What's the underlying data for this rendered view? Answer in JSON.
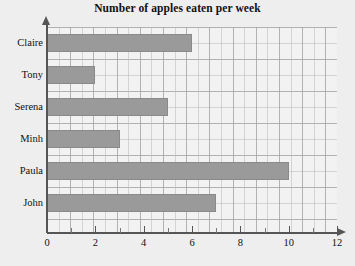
{
  "chart_data": {
    "type": "bar",
    "orientation": "horizontal",
    "title": "Number of apples eaten per week",
    "xlabel": "",
    "ylabel": "",
    "categories": [
      "Claire",
      "Tony",
      "Serena",
      "Minh",
      "Paula",
      "John"
    ],
    "values": [
      6,
      2,
      5,
      3,
      10,
      7
    ],
    "xlim": [
      0,
      12
    ],
    "x_ticks_major": [
      0,
      2,
      4,
      6,
      8,
      10,
      12
    ],
    "x_tick_labels": [
      "0",
      "2",
      "4",
      "6",
      "8",
      "10",
      "12"
    ],
    "x_ticks_minor": [
      1,
      3,
      5,
      7,
      9,
      11
    ],
    "grid": true,
    "legend": "none",
    "bar_color": "#9a9a9a",
    "bar_border_color": "#8a8a8a",
    "axis_color": "#555555",
    "background_color": "#eeeeee",
    "plot_background_color": "#f2f2f2"
  }
}
